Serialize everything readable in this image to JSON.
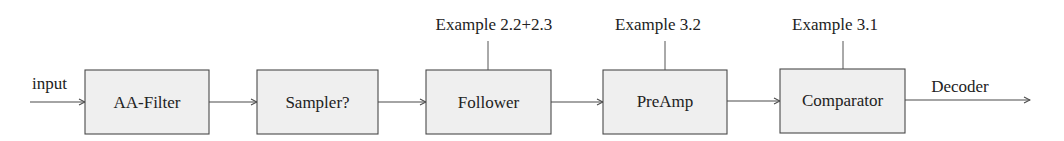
{
  "diagram": {
    "type": "signal-chain block diagram",
    "colors": {
      "block_fill": "#efefef",
      "block_stroke": "#4a4a4a",
      "text": "#222222",
      "background": "#ffffff"
    },
    "input_label": "input",
    "output_label": "Decoder",
    "blocks": [
      {
        "id": "aa-filter",
        "label": "AA-Filter",
        "annotation": null
      },
      {
        "id": "sampler",
        "label": "Sampler?",
        "annotation": null
      },
      {
        "id": "follower",
        "label": "Follower",
        "annotation": "Example 2.2+2.3"
      },
      {
        "id": "preamp",
        "label": "PreAmp",
        "annotation": "Example 3.2"
      },
      {
        "id": "comparator",
        "label": "Comparator",
        "annotation": "Example 3.1"
      }
    ],
    "connections": [
      {
        "from": "input",
        "to": "aa-filter"
      },
      {
        "from": "aa-filter",
        "to": "sampler"
      },
      {
        "from": "sampler",
        "to": "follower"
      },
      {
        "from": "follower",
        "to": "preamp"
      },
      {
        "from": "preamp",
        "to": "comparator"
      },
      {
        "from": "comparator",
        "to": "output"
      }
    ]
  }
}
